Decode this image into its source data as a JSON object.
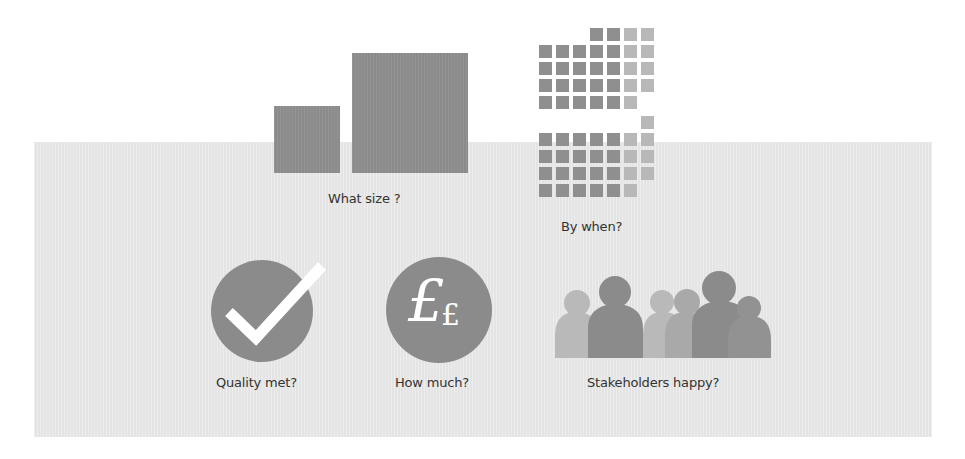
{
  "colors": {
    "panel_background": "#e4e4e4",
    "dark_fill": "#8b8b8b",
    "light_fill": "#b8b8b8",
    "medium_fill": "#a8a8a8",
    "icon_glyph": "#ffffff",
    "label_text": "#333333"
  },
  "size": {
    "label": "What size ?",
    "squares": [
      {
        "name": "small",
        "x": 274,
        "y": 106,
        "w": 66,
        "h": 67
      },
      {
        "name": "large",
        "x": 352,
        "y": 53,
        "w": 116,
        "h": 120
      }
    ]
  },
  "timeline": {
    "label": "By when?",
    "grid": {
      "origin_x": 539,
      "pitch": 17,
      "cell_size": 13,
      "blocks": [
        {
          "origin_y": 28,
          "rows": [
            [
              null,
              null,
              null,
              "dark",
              "dark",
              "light",
              "light"
            ],
            [
              "dark",
              "dark",
              "dark",
              "dark",
              "dark",
              "light",
              "light"
            ],
            [
              "dark",
              "dark",
              "dark",
              "dark",
              "dark",
              "light",
              "light"
            ],
            [
              "dark",
              "dark",
              "dark",
              "dark",
              "dark",
              "light",
              "light"
            ],
            [
              "dark",
              "dark",
              "dark",
              "dark",
              "dark",
              "light",
              null
            ]
          ]
        },
        {
          "origin_y": 116,
          "rows": [
            [
              null,
              null,
              null,
              null,
              null,
              null,
              "light"
            ],
            [
              "dark",
              "dark",
              "dark",
              "dark",
              "dark",
              "light",
              "light"
            ],
            [
              "dark",
              "dark",
              "dark",
              "dark",
              "dark",
              "light",
              "light"
            ],
            [
              "dark",
              "dark",
              "dark",
              "dark",
              "dark",
              "light",
              "light"
            ],
            [
              "dark",
              "dark",
              "dark",
              "dark",
              "dark",
              "light",
              null
            ]
          ]
        }
      ]
    }
  },
  "quality": {
    "label": "Quality met?",
    "icon": "checkmark-circle-icon"
  },
  "cost": {
    "label": "How much?",
    "icon": "pound-sterling-circle-icon",
    "glyph_large": "£",
    "glyph_small": "£"
  },
  "stakeholders": {
    "label": "Stakeholders happy?",
    "icon": "people-group-icon",
    "figures": [
      {
        "cx": 577,
        "head_cy": 303,
        "head_r": 13,
        "body_l": 555,
        "body_r": 598,
        "shoulder_y": 318,
        "tone": "light"
      },
      {
        "cx": 615,
        "head_cy": 292,
        "head_r": 16,
        "body_l": 588,
        "body_r": 643,
        "shoulder_y": 310,
        "tone": "dark"
      },
      {
        "cx": 662,
        "head_cy": 302,
        "head_r": 12,
        "body_l": 643,
        "body_r": 683,
        "shoulder_y": 318,
        "tone": "light"
      },
      {
        "cx": 687,
        "head_cy": 302,
        "head_r": 13,
        "body_l": 665,
        "body_r": 707,
        "shoulder_y": 318,
        "tone": "medium"
      },
      {
        "cx": 719,
        "head_cy": 288,
        "head_r": 17,
        "body_l": 692,
        "body_r": 750,
        "shoulder_y": 307,
        "tone": "dark"
      },
      {
        "cx": 749,
        "head_cy": 308,
        "head_r": 12,
        "body_l": 728,
        "body_r": 771,
        "shoulder_y": 322,
        "tone": "dark2"
      }
    ],
    "ground_y": 358
  }
}
